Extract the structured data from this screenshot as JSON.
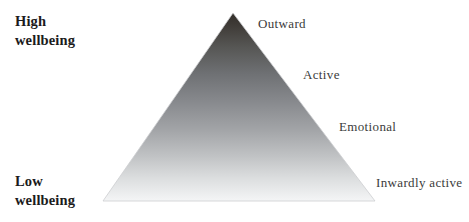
{
  "figure": {
    "background_color": "#ffffff",
    "width": 469,
    "height": 222
  },
  "axis": {
    "high": {
      "line1": "High",
      "line2": "wellbeing"
    },
    "low": {
      "line1": "Low",
      "line2": "wellbeing"
    }
  },
  "triangle": {
    "apex_color": "#3a3631",
    "mid_color": "#8d9094",
    "base_color": "#f2f3f4",
    "edge_color": "#c9cacb",
    "apex": {
      "x": 233,
      "y": 13
    },
    "bottom_left": {
      "x": 103,
      "y": 201
    },
    "bottom_right": {
      "x": 375,
      "y": 201
    }
  },
  "nodes": [
    {
      "id": "outward",
      "label": "Outward"
    },
    {
      "id": "active",
      "label": "Active"
    },
    {
      "id": "emotional",
      "label": "Emotional"
    },
    {
      "id": "inwardly-active",
      "label": "Inwardly active"
    }
  ]
}
